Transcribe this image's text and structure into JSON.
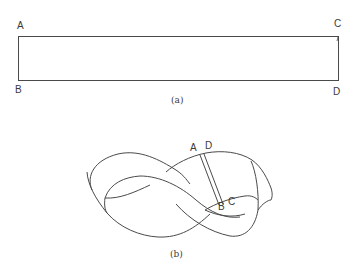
{
  "figure_a": {
    "caption": "(a)",
    "corners": {
      "top_left": "A",
      "top_right": "C",
      "bottom_left": "B",
      "bottom_right": "D"
    },
    "shape": "rectangular strip"
  },
  "figure_b": {
    "caption": "(b)",
    "labels": {
      "a": "A",
      "d": "D",
      "b": "B",
      "c": "C"
    },
    "shape": "Möbius strip (figure-eight twisted band)"
  },
  "colors": {
    "line": "#4a4a4a",
    "background": "#ffffff"
  }
}
